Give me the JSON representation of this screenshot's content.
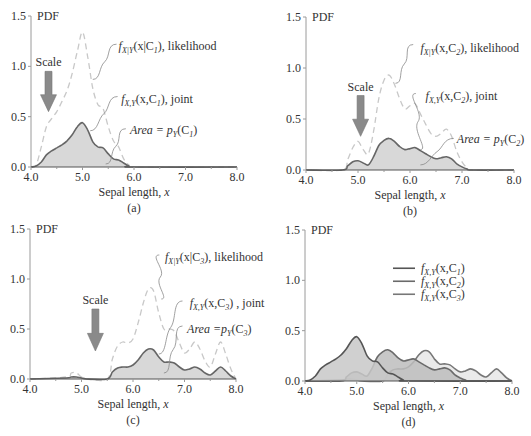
{
  "figure": {
    "width": 531,
    "height": 436,
    "colors": {
      "axis": "#9a9a9a",
      "text": "#333333",
      "joint_line": "#666666",
      "joint_fill": "#d8d8d8",
      "likelihood_dash": "#c8c8c8",
      "arrow_fill": "#8a8a8a",
      "c1_line": "#555555",
      "c1_fill": "#c8c8c8",
      "c2_line": "#6a6a6a",
      "c2_fill": "#bdbdbd",
      "c3_line": "#777777",
      "c3_fill": "#e6e6e6"
    }
  },
  "chart_data": [
    {
      "id": "a",
      "type": "line",
      "panel_label": "(a)",
      "ylabel": "PDF",
      "xlabel": "Sepal length, x",
      "xlim": [
        4.0,
        8.0
      ],
      "ylim": [
        0.0,
        1.5
      ],
      "xticks": [
        "4.0",
        "5.0",
        "6.0",
        "7.0",
        "8.0"
      ],
      "yticks": [
        "0.0",
        "0.5",
        "1.0",
        "1.5"
      ],
      "grid": false,
      "frame": {
        "x0": 31,
        "x1": 237,
        "y0": 167,
        "y1": 16
      },
      "scale_label": "Scale",
      "scale_arrow": {
        "x": 4.34,
        "ytop": 0.95,
        "ybot": 0.55
      },
      "annotations": [
        {
          "text_parts": [
            "f",
            "X|Y",
            "(x|C",
            "1",
            "), likelihood"
          ],
          "tx": 5.7,
          "ty": 1.2,
          "from": [
            5.7,
            1.22
          ],
          "to": [
            5.2,
            0.87
          ]
        },
        {
          "text_parts": [
            "f",
            "X,Y",
            "(x,C",
            "1",
            "), joint"
          ],
          "tx": 5.75,
          "ty": 0.68,
          "from": [
            5.72,
            0.7
          ],
          "to": [
            5.15,
            0.36
          ]
        },
        {
          "text_parts": [
            "Area = p",
            "Y",
            "(C",
            "1",
            ")"
          ],
          "tx": 5.92,
          "ty": 0.37,
          "from": [
            5.88,
            0.38
          ],
          "to": [
            5.45,
            0.03
          ]
        }
      ],
      "series": [
        {
          "name": "Likelihood f_X|Y(x|C1)",
          "style": "dashed",
          "x": [
            4.0,
            4.1,
            4.2,
            4.3,
            4.4,
            4.5,
            4.6,
            4.7,
            4.8,
            4.9,
            5.0,
            5.1,
            5.2,
            5.3,
            5.4,
            5.5,
            5.6,
            5.7,
            5.8,
            5.9,
            6.0,
            8.0
          ],
          "y": [
            0.0,
            0.02,
            0.2,
            0.4,
            0.48,
            0.55,
            0.65,
            0.76,
            0.93,
            1.15,
            1.34,
            1.1,
            0.78,
            0.62,
            0.58,
            0.4,
            0.26,
            0.2,
            0.08,
            0.02,
            0.0,
            0.0
          ]
        },
        {
          "name": "Joint f_X,Y(x,C1)",
          "style": "filled",
          "x": [
            4.0,
            4.1,
            4.2,
            4.3,
            4.4,
            4.5,
            4.6,
            4.7,
            4.8,
            4.9,
            5.0,
            5.1,
            5.2,
            5.3,
            5.4,
            5.5,
            5.6,
            5.7,
            5.8,
            5.9,
            6.0,
            8.0
          ],
          "y": [
            0.0,
            0.01,
            0.05,
            0.12,
            0.16,
            0.19,
            0.22,
            0.26,
            0.32,
            0.4,
            0.44,
            0.37,
            0.25,
            0.2,
            0.19,
            0.13,
            0.08,
            0.07,
            0.04,
            0.01,
            0.0,
            0.0
          ]
        }
      ]
    },
    {
      "id": "b",
      "type": "line",
      "panel_label": "(b)",
      "ylabel": "PDF",
      "xlabel": "Sepal length, x",
      "xlim": [
        4.0,
        8.0
      ],
      "ylim": [
        0.0,
        1.5
      ],
      "xticks": [
        "4.0",
        "5.0",
        "6.0",
        "7.0",
        "8.0"
      ],
      "yticks": [
        "0.0",
        "0.5",
        "1.0",
        "1.5"
      ],
      "grid": false,
      "frame": {
        "x0": 306,
        "x1": 514,
        "y0": 170,
        "y1": 17
      },
      "scale_label": "Scale",
      "scale_arrow": {
        "x": 5.05,
        "ytop": 0.73,
        "ybot": 0.33
      },
      "annotations": [
        {
          "text_parts": [
            "f",
            "X|Y",
            "(x,C",
            "2",
            "), likelihood"
          ],
          "tx": 6.2,
          "ty": 1.2,
          "from": [
            6.1,
            1.23
          ],
          "to": [
            5.72,
            0.85
          ]
        },
        {
          "text_parts": [
            "f",
            "X,Y",
            "(x,C",
            "2",
            "), joint"
          ],
          "tx": 6.3,
          "ty": 0.73,
          "from": [
            6.15,
            0.75
          ],
          "to": [
            6.2,
            0.2
          ]
        },
        {
          "text_parts": [
            "Area = p",
            "Y",
            "(C",
            "2",
            ")"
          ],
          "tx": 6.9,
          "ty": 0.3,
          "from": [
            6.88,
            0.31
          ],
          "to": [
            6.2,
            0.05
          ]
        }
      ],
      "series": [
        {
          "name": "Likelihood f_X|Y(x,C2)",
          "style": "dashed",
          "x": [
            4.0,
            4.7,
            4.8,
            4.9,
            5.0,
            5.1,
            5.2,
            5.3,
            5.4,
            5.5,
            5.6,
            5.7,
            5.8,
            5.9,
            6.0,
            6.1,
            6.2,
            6.3,
            6.4,
            6.5,
            6.6,
            6.7,
            6.8,
            6.9,
            7.0,
            7.1,
            7.2,
            8.0
          ],
          "y": [
            0.0,
            0.0,
            0.1,
            0.22,
            0.28,
            0.2,
            0.16,
            0.38,
            0.7,
            0.88,
            0.93,
            0.84,
            0.7,
            0.6,
            0.63,
            0.65,
            0.55,
            0.45,
            0.36,
            0.33,
            0.36,
            0.4,
            0.33,
            0.18,
            0.08,
            0.02,
            0.0,
            0.0
          ]
        },
        {
          "name": "Joint f_X,Y(x,C2)",
          "style": "filled",
          "x": [
            4.0,
            4.7,
            4.8,
            4.9,
            5.0,
            5.1,
            5.2,
            5.3,
            5.4,
            5.5,
            5.6,
            5.7,
            5.8,
            5.9,
            6.0,
            6.1,
            6.2,
            6.3,
            6.4,
            6.5,
            6.6,
            6.7,
            6.8,
            6.9,
            7.0,
            7.1,
            7.2,
            8.0
          ],
          "y": [
            0.0,
            0.0,
            0.04,
            0.08,
            0.09,
            0.07,
            0.05,
            0.13,
            0.24,
            0.29,
            0.31,
            0.28,
            0.23,
            0.2,
            0.21,
            0.22,
            0.19,
            0.16,
            0.13,
            0.11,
            0.12,
            0.13,
            0.11,
            0.06,
            0.03,
            0.01,
            0.0,
            0.0
          ]
        }
      ]
    },
    {
      "id": "c",
      "type": "line",
      "panel_label": "(c)",
      "ylabel": "PDF",
      "xlabel": "Sepal length, x",
      "xlim": [
        4.0,
        8.0
      ],
      "ylim": [
        0.0,
        1.5
      ],
      "xticks": [
        "4.0",
        "5.0",
        "6.0",
        "7.0",
        "8.0"
      ],
      "yticks": [
        "0.0",
        "0.5",
        "1.0",
        "1.5"
      ],
      "grid": false,
      "frame": {
        "x0": 30,
        "x1": 236,
        "y0": 379,
        "y1": 229
      },
      "scale_label": "Scale",
      "scale_arrow": {
        "x": 5.27,
        "ytop": 0.7,
        "ybot": 0.28
      },
      "annotations": [
        {
          "text_parts": [
            "f",
            "X|Y",
            "(x|C",
            "3",
            "), likelihood"
          ],
          "tx": 6.62,
          "ty": 1.22,
          "from": [
            6.55,
            1.24
          ],
          "to": [
            6.55,
            0.8
          ]
        },
        {
          "text_parts": [
            "f",
            "X,Y",
            "(x,C",
            "3",
            ") , joint"
          ],
          "tx": 7.1,
          "ty": 0.76,
          "from": [
            7.0,
            0.78
          ],
          "to": [
            6.5,
            0.25
          ]
        },
        {
          "text_parts": [
            "Area =p",
            "Y",
            "(C",
            "3",
            ")"
          ],
          "tx": 7.05,
          "ty": 0.5,
          "from": [
            7.0,
            0.53
          ],
          "to": [
            6.6,
            0.06
          ]
        }
      ],
      "series": [
        {
          "name": "Likelihood f_X|Y(x|C3)",
          "style": "dashed",
          "x": [
            4.0,
            4.7,
            4.8,
            4.9,
            5.0,
            5.1,
            5.5,
            5.6,
            5.7,
            5.8,
            5.9,
            6.0,
            6.1,
            6.2,
            6.3,
            6.4,
            6.5,
            6.6,
            6.7,
            6.8,
            6.9,
            7.0,
            7.1,
            7.2,
            7.3,
            7.4,
            7.5,
            7.6,
            7.7,
            7.8,
            7.9,
            8.0
          ],
          "y": [
            0.0,
            0.02,
            0.06,
            0.06,
            0.02,
            0.0,
            0.0,
            0.2,
            0.33,
            0.37,
            0.36,
            0.4,
            0.56,
            0.76,
            0.9,
            0.88,
            0.66,
            0.5,
            0.5,
            0.48,
            0.36,
            0.26,
            0.3,
            0.37,
            0.3,
            0.18,
            0.12,
            0.25,
            0.37,
            0.25,
            0.1,
            0.0
          ]
        },
        {
          "name": "Joint f_X,Y(x,C3)",
          "style": "filled",
          "x": [
            4.0,
            4.7,
            4.8,
            4.9,
            5.0,
            5.1,
            5.5,
            5.6,
            5.7,
            5.8,
            5.9,
            6.0,
            6.1,
            6.2,
            6.3,
            6.4,
            6.5,
            6.6,
            6.7,
            6.8,
            6.9,
            7.0,
            7.1,
            7.2,
            7.3,
            7.4,
            7.5,
            7.6,
            7.7,
            7.8,
            7.9,
            8.0
          ],
          "y": [
            0.0,
            0.01,
            0.02,
            0.02,
            0.01,
            0.0,
            0.0,
            0.07,
            0.11,
            0.12,
            0.12,
            0.14,
            0.19,
            0.26,
            0.3,
            0.29,
            0.22,
            0.17,
            0.17,
            0.16,
            0.12,
            0.09,
            0.1,
            0.12,
            0.1,
            0.06,
            0.04,
            0.08,
            0.12,
            0.08,
            0.03,
            0.0
          ]
        }
      ]
    },
    {
      "id": "d",
      "type": "area",
      "panel_label": "(d)",
      "ylabel": "PDF",
      "xlabel": "Sepal length, x",
      "xlim": [
        4.0,
        8.0
      ],
      "ylim": [
        0.0,
        1.5
      ],
      "xticks": [
        "4.0",
        "5.0",
        "6.0",
        "7.0",
        "8.0"
      ],
      "yticks": [
        "0.0",
        "0.5",
        "1.0",
        "1.5"
      ],
      "grid": false,
      "frame": {
        "x0": 305,
        "x1": 512,
        "y0": 381,
        "y1": 230
      },
      "legend": {
        "position": "upper right",
        "entries": [
          {
            "parts": [
              "f",
              "X,Y",
              "(x,C",
              "1",
              ")"
            ],
            "color_key": "c1_line"
          },
          {
            "parts": [
              "f",
              "X,Y",
              "(x,C",
              "2",
              ")"
            ],
            "color_key": "c2_line"
          },
          {
            "parts": [
              "f",
              "X,Y",
              "(x,C",
              "3",
              ")"
            ],
            "color_key": "c3_line"
          }
        ]
      },
      "series": [
        {
          "name": "f_X,Y(x,C3)",
          "style": "filled",
          "fill_key": "c3_fill",
          "line_key": "c3_line",
          "x": [
            4.0,
            4.7,
            4.8,
            4.9,
            5.0,
            5.1,
            5.5,
            5.6,
            5.7,
            5.8,
            5.9,
            6.0,
            6.1,
            6.2,
            6.3,
            6.4,
            6.5,
            6.6,
            6.7,
            6.8,
            6.9,
            7.0,
            7.1,
            7.2,
            7.3,
            7.4,
            7.5,
            7.6,
            7.7,
            7.8,
            7.9,
            8.0
          ],
          "y": [
            0.0,
            0.01,
            0.02,
            0.02,
            0.01,
            0.0,
            0.0,
            0.07,
            0.11,
            0.12,
            0.12,
            0.14,
            0.19,
            0.26,
            0.3,
            0.29,
            0.22,
            0.17,
            0.17,
            0.16,
            0.12,
            0.09,
            0.1,
            0.12,
            0.1,
            0.06,
            0.04,
            0.08,
            0.12,
            0.08,
            0.03,
            0.0
          ]
        },
        {
          "name": "f_X,Y(x,C2)",
          "style": "filled",
          "fill_key": "c2_fill",
          "line_key": "c2_line",
          "x": [
            4.0,
            4.7,
            4.8,
            4.9,
            5.0,
            5.1,
            5.2,
            5.3,
            5.4,
            5.5,
            5.6,
            5.7,
            5.8,
            5.9,
            6.0,
            6.1,
            6.2,
            6.3,
            6.4,
            6.5,
            6.6,
            6.7,
            6.8,
            6.9,
            7.0,
            7.1,
            7.2,
            8.0
          ],
          "y": [
            0.0,
            0.0,
            0.04,
            0.08,
            0.09,
            0.07,
            0.05,
            0.13,
            0.24,
            0.29,
            0.31,
            0.28,
            0.23,
            0.2,
            0.21,
            0.22,
            0.19,
            0.16,
            0.13,
            0.11,
            0.12,
            0.13,
            0.11,
            0.06,
            0.03,
            0.01,
            0.0,
            0.0
          ]
        },
        {
          "name": "f_X,Y(x,C1)",
          "style": "filled",
          "fill_key": "c1_fill",
          "line_key": "c1_line",
          "x": [
            4.0,
            4.1,
            4.2,
            4.3,
            4.4,
            4.5,
            4.6,
            4.7,
            4.8,
            4.9,
            5.0,
            5.1,
            5.2,
            5.3,
            5.4,
            5.5,
            5.6,
            5.7,
            5.8,
            5.9,
            6.0,
            8.0
          ],
          "y": [
            0.0,
            0.01,
            0.05,
            0.12,
            0.16,
            0.19,
            0.22,
            0.26,
            0.32,
            0.4,
            0.44,
            0.37,
            0.25,
            0.2,
            0.19,
            0.13,
            0.08,
            0.07,
            0.04,
            0.01,
            0.0,
            0.0
          ]
        }
      ]
    }
  ]
}
